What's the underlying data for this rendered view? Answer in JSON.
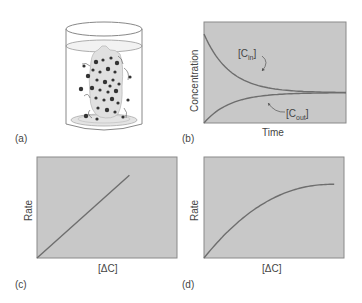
{
  "panels": {
    "a": {
      "label": "(a)"
    },
    "b": {
      "label": "(b)",
      "xlabel": "Time",
      "ylabel": "Concentration",
      "curve_in_label_main": "[C",
      "curve_in_label_sub": "in",
      "curve_out_label_main": "[C",
      "curve_out_label_sub": "out",
      "bracket_close": "]"
    },
    "c": {
      "label": "(c)",
      "xlabel": "[ΔC]",
      "ylabel": "Rate"
    },
    "d": {
      "label": "(d)",
      "xlabel": "[ΔC]",
      "ylabel": "Rate"
    }
  },
  "colors": {
    "plot_bg": "#c8c8c8",
    "frame": "#8a8a8a",
    "curve": "#6e6e6e"
  },
  "chart_data": [
    {
      "type": "line",
      "title": "",
      "xlabel": "Time",
      "ylabel": "Concentration",
      "series": [
        {
          "name": "[C_in]",
          "shape": "exponential decay to equilibrium",
          "x": [
            0,
            0.25,
            0.5,
            0.75,
            1.0
          ],
          "y": [
            0.88,
            0.55,
            0.38,
            0.3,
            0.3
          ]
        },
        {
          "name": "[C_out]",
          "shape": "exponential rise to equilibrium",
          "x": [
            0,
            0.25,
            0.5,
            0.75,
            1.0
          ],
          "y": [
            0.0,
            0.17,
            0.25,
            0.29,
            0.3
          ]
        }
      ],
      "xlim": [
        0,
        1
      ],
      "ylim": [
        0,
        1
      ]
    },
    {
      "type": "line",
      "xlabel": "[ΔC]",
      "ylabel": "Rate",
      "series": [
        {
          "name": "rate",
          "shape": "linear",
          "x": [
            0,
            0.66
          ],
          "y": [
            0,
            0.82
          ]
        }
      ],
      "xlim": [
        0,
        1
      ],
      "ylim": [
        0,
        1
      ]
    },
    {
      "type": "line",
      "xlabel": "[ΔC]",
      "ylabel": "Rate",
      "series": [
        {
          "name": "rate",
          "shape": "saturating",
          "x": [
            0,
            0.2,
            0.4,
            0.6,
            0.8,
            0.93
          ],
          "y": [
            0,
            0.35,
            0.57,
            0.7,
            0.73,
            0.73
          ]
        }
      ],
      "xlim": [
        0,
        1
      ],
      "ylim": [
        0,
        1
      ]
    }
  ]
}
